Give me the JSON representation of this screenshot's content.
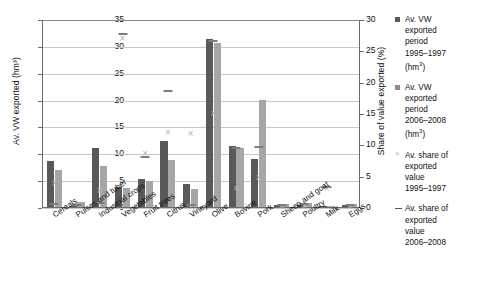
{
  "chart_data": {
    "type": "bar",
    "title": "",
    "xlabel": "",
    "ylabel": "Av. VW exported (hm³)",
    "ylabel_right": "Share of value exported (%)",
    "ylim": [
      0,
      35
    ],
    "ylim_right": [
      0,
      30
    ],
    "yticks": [
      0,
      5,
      10,
      15,
      20,
      25,
      30,
      35
    ],
    "yticks_right": [
      0,
      5,
      10,
      15,
      20,
      25,
      30
    ],
    "grid": true,
    "legend_position": "right",
    "categories": [
      "Cereals",
      "Pulses and tuber",
      "Industrial crops",
      "Vegetables",
      "Fruit trees",
      "Citrus",
      "Vineyard",
      "Olive",
      "Bovine",
      "Pork",
      "Sheep and goat",
      "Poultry",
      "Milk",
      "Eggs"
    ],
    "series": [
      {
        "name": "Av. VW exported period 1995–1997 (hm³)",
        "axis": "left",
        "type": "bar",
        "color": "#595959",
        "values": [
          8.6,
          0.2,
          11.0,
          3.8,
          5.2,
          12.2,
          4.3,
          31.3,
          11.3,
          9.0,
          0.4,
          0.3,
          0.0,
          0.3
        ]
      },
      {
        "name": "Av. VW exported period 2006–2008 (hm³)",
        "axis": "left",
        "type": "bar",
        "color": "#a6a6a6",
        "values": [
          6.8,
          0.9,
          7.6,
          3.6,
          4.9,
          8.7,
          3.4,
          30.6,
          11.0,
          20.0,
          0.6,
          0.7,
          0.1,
          0.6
        ]
      },
      {
        "name": "Av. share of exported value 1995–1997",
        "axis": "right",
        "type": "scatter",
        "marker": "x",
        "color": "#b3b3b3",
        "values": [
          3.9,
          0.5,
          2.7,
          27.0,
          8.6,
          12.0,
          11.8,
          15.0,
          3.0,
          4.8,
          0.2,
          0.2,
          3.0,
          0.2
        ]
      },
      {
        "name": "Av. share of exported value 2006–2008",
        "axis": "right",
        "type": "scatter",
        "marker": "dash",
        "color": "#7d7d7d",
        "values": [
          0.6,
          0.5,
          0.8,
          27.7,
          8.2,
          18.6,
          0.4,
          26.6,
          9.6,
          9.7,
          0.4,
          0.6,
          3.4,
          0.4
        ]
      }
    ]
  },
  "legend": {
    "items": [
      {
        "marker": "square-dark",
        "lines": [
          "Av. VW",
          "exported",
          "period",
          "1995–1997",
          "(hm³)"
        ]
      },
      {
        "marker": "square-light",
        "lines": [
          "Av. VW",
          "exported",
          "period",
          "2006–2008",
          "(hm³)"
        ]
      },
      {
        "marker": "x-mark",
        "lines": [
          "Av. share of",
          "exported",
          "value",
          "1995–1997"
        ]
      },
      {
        "marker": "dash-mark",
        "lines": [
          "Av. share of",
          "exported",
          "value",
          "2006–2008"
        ]
      }
    ]
  }
}
